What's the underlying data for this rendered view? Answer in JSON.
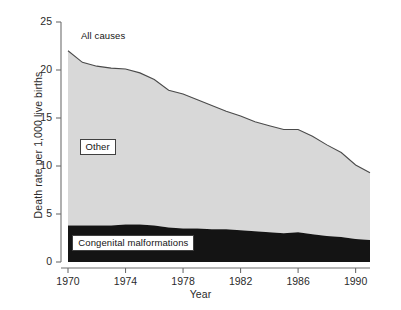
{
  "chart_data": {
    "type": "area",
    "title": "",
    "subtitle": "",
    "xlabel": "Year",
    "ylabel": "Death rate per 1,000 live births",
    "xlim": [
      1970,
      1991
    ],
    "ylim": [
      0,
      25
    ],
    "xticks": [
      1970,
      1974,
      1978,
      1982,
      1986,
      1990
    ],
    "xtick_labels": [
      "1970",
      "1974",
      "1978",
      "1982",
      "1986",
      "1990"
    ],
    "yticks": [
      0,
      5,
      10,
      15,
      20,
      25
    ],
    "ytick_labels": [
      "0",
      "5",
      "10",
      "15",
      "20",
      "25"
    ],
    "grid": false,
    "legend_position": "inline-annotations",
    "stacked": true,
    "x": [
      1970,
      1971,
      1972,
      1973,
      1974,
      1975,
      1976,
      1977,
      1978,
      1979,
      1980,
      1981,
      1982,
      1983,
      1984,
      1985,
      1986,
      1987,
      1988,
      1989,
      1990,
      1991
    ],
    "series": [
      {
        "name": "Congenital malformations",
        "color": "#141414",
        "label_style": "boxed",
        "values": [
          3.8,
          3.8,
          3.8,
          3.8,
          3.9,
          3.9,
          3.8,
          3.6,
          3.5,
          3.5,
          3.4,
          3.4,
          3.3,
          3.2,
          3.1,
          3.0,
          3.1,
          2.9,
          2.7,
          2.6,
          2.4,
          2.3
        ]
      },
      {
        "name": "Other",
        "color": "#d8d8d8",
        "label_style": "boxed",
        "values": [
          18.2,
          17.0,
          16.6,
          16.4,
          16.2,
          15.8,
          15.2,
          14.3,
          14.0,
          13.4,
          12.9,
          12.3,
          11.9,
          11.4,
          11.1,
          10.8,
          10.7,
          10.2,
          9.5,
          8.8,
          7.7,
          7.0
        ]
      }
    ],
    "total_series": {
      "name": "All causes",
      "label_style": "plain",
      "color": "#4a4a4a",
      "values": [
        22.0,
        20.8,
        20.4,
        20.2,
        20.1,
        19.7,
        19.0,
        17.9,
        17.5,
        16.9,
        16.3,
        15.7,
        15.2,
        14.6,
        14.2,
        13.8,
        13.8,
        13.1,
        12.2,
        11.4,
        10.1,
        9.3
      ]
    },
    "annotations": [
      {
        "id": "all-causes",
        "text": "All causes",
        "x": 1970.9,
        "y": 23.4,
        "style": "plain"
      },
      {
        "id": "other",
        "text": "Other",
        "x": 1970.8,
        "y": 12.1,
        "style": "boxed"
      },
      {
        "id": "congenital-malformations",
        "text": "Congenital malformations",
        "x": 1970.3,
        "y": 2.1,
        "style": "boxed"
      }
    ],
    "colors": {
      "other_fill": "#d8d8d8",
      "congenital_fill": "#141414",
      "outline": "#4a4a4a",
      "axis": "#6e6e6e",
      "text": "#2b2b2b",
      "background": "#ffffff"
    }
  }
}
